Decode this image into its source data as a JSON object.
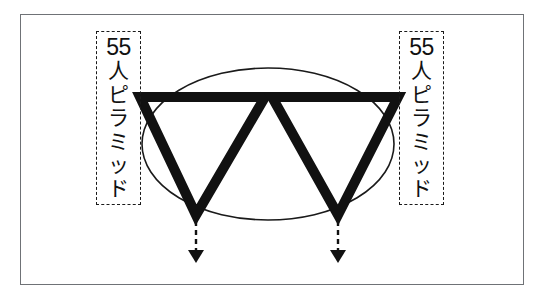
{
  "diagram": {
    "title_visible": false,
    "background_color": "#ffffff",
    "frame": {
      "stroke_color": "#6f7276",
      "x": 20,
      "y": 14,
      "width": 504,
      "height": 271
    },
    "labels": [
      {
        "id": "left-label",
        "number": "55",
        "vertical_characters": [
          "人",
          "ピ",
          "ラ",
          "ミ",
          "ッ",
          "ド"
        ],
        "full_text": "55人ピラミッド",
        "box": {
          "x": 96,
          "y": 31,
          "width": 45,
          "height": 174
        },
        "border_style": "dashed",
        "color": "#111111"
      },
      {
        "id": "right-label",
        "number": "55",
        "vertical_characters": [
          "人",
          "ピ",
          "ラ",
          "ミ",
          "ッ",
          "ド"
        ],
        "full_text": "55人ピラミッド",
        "box": {
          "x": 399,
          "y": 31,
          "width": 45,
          "height": 174
        },
        "border_style": "dashed",
        "color": "#111111"
      }
    ],
    "shapes": {
      "ellipse": {
        "name": "outline-ellipse",
        "center_x": 268,
        "center_y": 144,
        "radius_x": 126,
        "radius_y": 76,
        "stroke_color": "#1a1a1a",
        "stroke_width": 1.5,
        "fill": "none"
      },
      "triangles": [
        {
          "name": "left-triangle",
          "orientation": "down",
          "top_left_x": 140,
          "top_right_x": 265,
          "top_y": 97,
          "apex_x": 196,
          "apex_y": 215,
          "stroke_color": "#111111",
          "stroke_width": 10,
          "fill": "none"
        },
        {
          "name": "right-triangle",
          "orientation": "down",
          "top_left_x": 272,
          "top_right_x": 398,
          "top_y": 97,
          "apex_x": 338,
          "apex_y": 215,
          "stroke_color": "#111111",
          "stroke_width": 10,
          "fill": "none"
        }
      ],
      "arrows": [
        {
          "name": "left-down-arrow",
          "x": 196,
          "start_y": 220,
          "end_y": 263,
          "style": "dashed",
          "head": "filled-triangle",
          "color": "#111111"
        },
        {
          "name": "right-down-arrow",
          "x": 338,
          "start_y": 220,
          "end_y": 263,
          "style": "dashed",
          "head": "filled-triangle",
          "color": "#111111"
        }
      ]
    },
    "colors": {
      "ink": "#111111",
      "frame": "#6f7276",
      "paper": "#ffffff"
    }
  }
}
